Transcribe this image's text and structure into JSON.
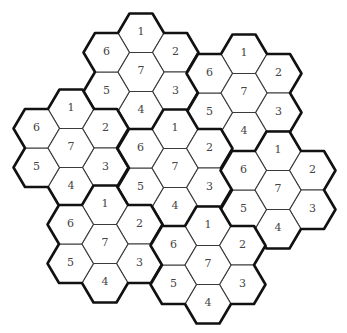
{
  "diagram": {
    "title": "",
    "hex_geometry": {
      "side": 23,
      "half_height": 19.5,
      "orientation": "flat-top"
    },
    "colors": {
      "thin_stroke": "#3a3a3a",
      "thick_stroke": "#111111",
      "text": "#444444",
      "fill": "#ffffff"
    },
    "cell_layout": [
      {
        "label": "1",
        "dx": 0,
        "dy": -39
      },
      {
        "label": "2",
        "dx": 34.5,
        "dy": -19.5
      },
      {
        "label": "3",
        "dx": 34.5,
        "dy": 19.5
      },
      {
        "label": "4",
        "dx": 0,
        "dy": 39
      },
      {
        "label": "5",
        "dx": -34.5,
        "dy": 19.5
      },
      {
        "label": "6",
        "dx": -34.5,
        "dy": -19.5
      },
      {
        "label": "7",
        "dx": 0,
        "dy": 0
      }
    ],
    "clusters": [
      {
        "name": "top",
        "cx": 141,
        "cy": 72,
        "cells": [
          "1",
          "2",
          "3",
          "4",
          "5",
          "6",
          "7"
        ]
      },
      {
        "name": "upper-right",
        "cx": 244,
        "cy": 93,
        "cells": [
          "1",
          "2",
          "3",
          "4",
          "5",
          "6",
          "7"
        ]
      },
      {
        "name": "left",
        "cx": 71,
        "cy": 148,
        "cells": [
          "1",
          "2",
          "3",
          "4",
          "5",
          "6",
          "7"
        ]
      },
      {
        "name": "center",
        "cx": 175,
        "cy": 168,
        "cells": [
          "1",
          "2",
          "3",
          "4",
          "5",
          "6",
          "7"
        ]
      },
      {
        "name": "right",
        "cx": 278,
        "cy": 190,
        "cells": [
          "1",
          "2",
          "3",
          "4",
          "5",
          "6",
          "7"
        ]
      },
      {
        "name": "bottom-left",
        "cx": 105,
        "cy": 244,
        "cells": [
          "1",
          "2",
          "3",
          "4",
          "5",
          "6",
          "7"
        ]
      },
      {
        "name": "bottom-center",
        "cx": 208,
        "cy": 265,
        "cells": [
          "1",
          "2",
          "3",
          "4",
          "5",
          "6",
          "7"
        ]
      }
    ]
  }
}
